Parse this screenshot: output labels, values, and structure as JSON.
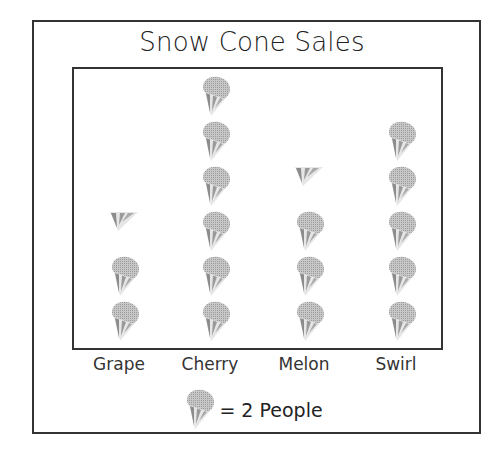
{
  "chart": {
    "title": "Snow Cone Sales",
    "key_text": "= 2 People",
    "icon_name": "snow-cone-icon"
  },
  "columns": [
    {
      "label": "Grape",
      "full": 2,
      "half": 1
    },
    {
      "label": "Cherry",
      "full": 6,
      "half": 0
    },
    {
      "label": "Melon",
      "full": 3,
      "half": 1
    },
    {
      "label": "Swirl",
      "full": 5,
      "half": 0
    }
  ],
  "chart_data": {
    "type": "bar",
    "subtype": "pictograph",
    "title": "Snow Cone Sales",
    "categories": [
      "Grape",
      "Cherry",
      "Melon",
      "Swirl"
    ],
    "values": [
      5,
      12,
      7,
      10
    ],
    "icon_counts": [
      2.5,
      6,
      3.5,
      5
    ],
    "icon_value": 2,
    "legend": "1 snow cone icon = 2 People",
    "xlabel": "",
    "ylabel": "",
    "grid": false
  }
}
